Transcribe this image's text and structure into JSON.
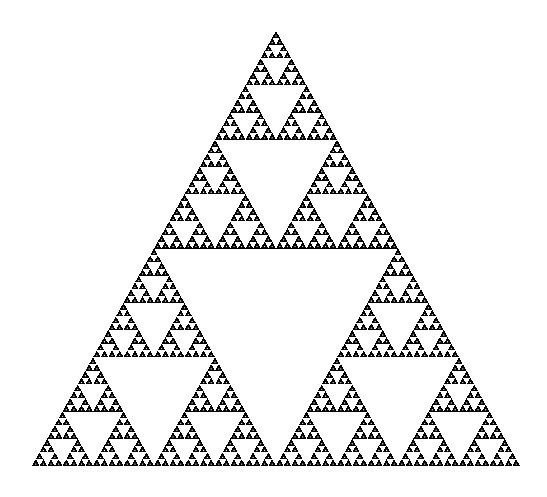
{
  "figure": {
    "title": "Sierpinski Triangle",
    "background_color": "#ffffff",
    "fill_color": "#000000",
    "hole_color": "#ffffff"
  },
  "chart_data": {
    "type": "diagram",
    "name": "sierpinski-gasket",
    "title": "Sierpinski Triangle",
    "subtitle": "",
    "xlabel": "",
    "ylabel": "",
    "grid": false,
    "legend": false,
    "canvas": {
      "width": 547,
      "height": 497
    },
    "geometry": {
      "apex": {
        "x": 276,
        "y": 31
      },
      "left_vertex": {
        "x": 32,
        "y": 466
      },
      "right_vertex": {
        "x": 520,
        "y": 466
      },
      "base_width": 488,
      "height": 435
    },
    "recursion": {
      "depth": 6,
      "rule": "remove-central-inverted-triangle",
      "subdivisions_per_level": 3,
      "filled_triangles_at_depth": 729,
      "smallest_triangle_base_px": 7.625
    },
    "colors": {
      "fill": "#000000",
      "hole": "#ffffff",
      "background": "#ffffff"
    },
    "texture": {
      "speckle": true,
      "speckle_color": "#ffffff",
      "note": "scanned raster dithering produces white specks inside filled regions"
    }
  }
}
